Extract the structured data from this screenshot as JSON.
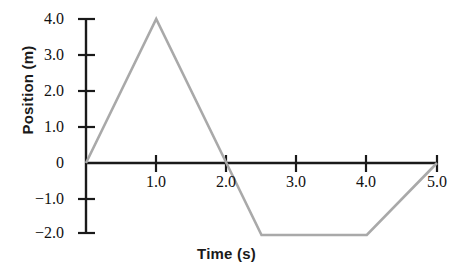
{
  "chart_data": {
    "type": "line",
    "title": "",
    "subtitle": "",
    "xlabel": "Time (s)",
    "ylabel": "Position (m)",
    "xlim": [
      0.0,
      5.15
    ],
    "ylim": [
      -2.3,
      4.25
    ],
    "grid": false,
    "legend": "none",
    "x_ticks": [
      1.0,
      2.0,
      3.0,
      4.0,
      5.0
    ],
    "x_tick_labels": [
      "1.0",
      "2.0",
      "3.0",
      "4.0",
      "5.0"
    ],
    "y_ticks": [
      4.0,
      3.0,
      2.0,
      1.0,
      0.0,
      -1.0,
      -2.0
    ],
    "y_tick_labels": [
      "4.0",
      "3.0",
      "2.0",
      "1.0",
      "0",
      "−1.0",
      "−2.0"
    ],
    "series": [
      {
        "name": "position",
        "color": "#a9a9a9",
        "x": [
          0.0,
          1.0,
          2.0,
          2.5,
          4.0,
          5.0
        ],
        "values": [
          0.0,
          4.0,
          0.0,
          -2.0,
          -2.0,
          0.0
        ]
      }
    ],
    "annotations": []
  },
  "colors": {
    "axis": "#1a1a1a",
    "data_line": "#a9a9a9",
    "background": "#ffffff",
    "text": "#111111"
  },
  "axes_label_font_size": "15px",
  "tick_font_size": "16px"
}
